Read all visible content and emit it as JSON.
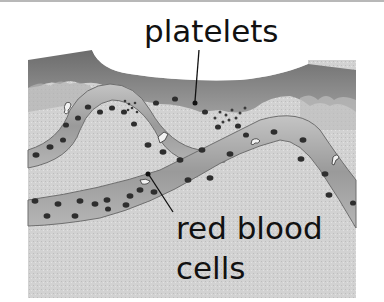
{
  "figure": {
    "labels": {
      "platelets": "platelets",
      "red_blood_cells_line1": "red blood",
      "red_blood_cells_line2": "cells"
    },
    "colors": {
      "tissue_dark": "#7a7a7a",
      "tissue_light": "#c9c9c9",
      "background_tissue": "#d4d4d4",
      "vessel_fill": "#a6a6a6",
      "vessel_edge": "#6e6e6e",
      "cell": "#2b2b2b",
      "leader_line": "#111111"
    }
  }
}
